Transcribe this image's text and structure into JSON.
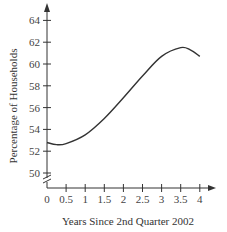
{
  "chart_data": {
    "type": "line",
    "title": "",
    "xlabel": "Years Since 2nd Quarter 2002",
    "ylabel": "Percentage of Households",
    "xlim": [
      0,
      4.2
    ],
    "ylim": [
      49,
      65
    ],
    "x_ticks": [
      "0",
      "0.5",
      "1",
      "1.5",
      "2",
      "2.5",
      "3",
      "3.5",
      "4"
    ],
    "y_ticks": [
      "50",
      "52",
      "54",
      "56",
      "58",
      "60",
      "62",
      "64"
    ],
    "y_axis_break": true,
    "grid": false,
    "legend": null,
    "series": [
      {
        "name": "Percentage of Households",
        "x": [
          0,
          0.25,
          0.5,
          1.0,
          1.5,
          2.0,
          2.5,
          3.0,
          3.5,
          3.75,
          4.0
        ],
        "y": [
          52.8,
          52.6,
          52.7,
          53.5,
          55.0,
          56.9,
          58.9,
          60.7,
          61.5,
          61.3,
          60.7
        ]
      }
    ]
  }
}
